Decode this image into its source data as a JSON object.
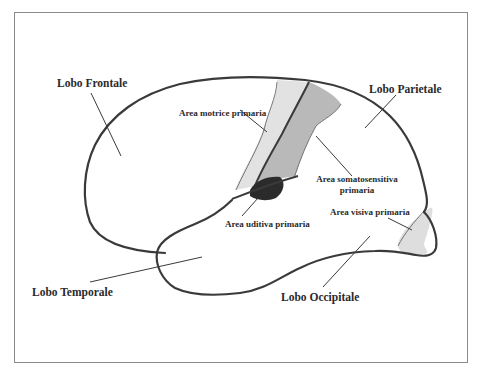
{
  "figure": {
    "type": "brain-lateral-view",
    "labels": {
      "frontal": "Lobo Frontale",
      "parietal": "Lobo Parietale",
      "temporal": "Lobo Temporale",
      "occipital": "Lobo Occipitale",
      "motor": "Area motrice primaria",
      "somatosensory_line1": "Area somatosensitiva",
      "somatosensory_line2": "primaria",
      "auditory": "Area uditiva primaria",
      "visual": "Area visiva primaria"
    },
    "colors": {
      "background": "#ffffff",
      "frame": "#8a8a8a",
      "outline": "#3a3a3a",
      "motor_fill": "#e2e2e2",
      "somatosensory_fill": "#b9b9b9",
      "auditory_fill": "#2b2b2b",
      "visual_fill": "#dedede",
      "text": "#2a2a2a"
    }
  }
}
